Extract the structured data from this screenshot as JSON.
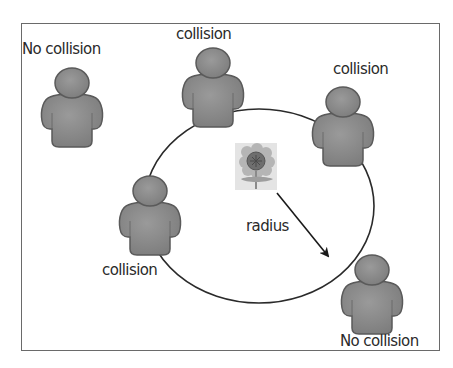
{
  "diagram": {
    "type": "collision-radius-illustration",
    "labels": {
      "top_left": "No collision",
      "top_center": "collision",
      "top_right": "collision",
      "left": "collision",
      "bottom_right": "No collision",
      "center": "radius"
    },
    "elements": {
      "center_object": "flower-icon",
      "figures": [
        {
          "id": "person-no-collision-top-left",
          "label": "No collision",
          "status": "no-collision"
        },
        {
          "id": "person-collision-top",
          "label": "collision",
          "status": "collision"
        },
        {
          "id": "person-collision-right",
          "label": "collision",
          "status": "collision"
        },
        {
          "id": "person-collision-left",
          "label": "collision",
          "status": "collision"
        },
        {
          "id": "person-no-collision-bottom-right",
          "label": "No collision",
          "status": "no-collision"
        }
      ]
    },
    "colors": {
      "figure": "#8a8a8a",
      "figure_outline": "#5a5a5a",
      "circle": "#2a2a2a",
      "frame": "#6a6a6a",
      "text": "#2a2a2a"
    }
  }
}
